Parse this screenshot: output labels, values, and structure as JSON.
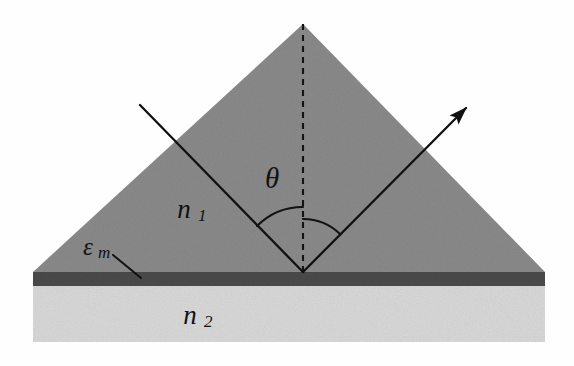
{
  "figure": {
    "name": "kretschmann-spr-prism-diagram",
    "background_color": "#fefefe"
  },
  "geometry": {
    "canvas": {
      "width": 574,
      "height": 366
    },
    "prism": {
      "apex": {
        "x": 303,
        "y": 24
      },
      "base_left": {
        "x": 33,
        "y": 272
      },
      "base_right": {
        "x": 545,
        "y": 272
      },
      "fill_color": "#8a8a8a"
    },
    "metal_film": {
      "x": 33,
      "y": 272,
      "width": 512,
      "height": 14,
      "fill_color": "#4a4a4a"
    },
    "substrate": {
      "x": 33,
      "y": 286,
      "width": 512,
      "height": 56,
      "fill_color": "#d8d8d8"
    },
    "reflection_point": {
      "x": 303,
      "y": 272
    },
    "normal_line": {
      "x": 303,
      "y_top": 24,
      "y_bottom": 272
    },
    "incident_ray": {
      "x1": 140,
      "y1": 105,
      "x2": 303,
      "y2": 272
    },
    "reflected_ray": {
      "x1": 303,
      "y1": 272,
      "x2": 470,
      "y2": 104
    },
    "leader_line": {
      "x1": 113,
      "y1": 255,
      "x2": 141,
      "y2": 278
    },
    "angle_arc_left_radius": 65,
    "angle_arc_right_radius": 53
  },
  "labels": {
    "theta": {
      "text": "θ",
      "meaning": "angle-of-incidence",
      "x": 272,
      "y": 181
    },
    "n1": {
      "symbol": "n",
      "subscript": "1",
      "meaning": "prism-refractive-index",
      "x": 184,
      "y": 212
    },
    "n2": {
      "symbol": "n",
      "subscript": "2",
      "meaning": "substrate-refractive-index",
      "x": 190,
      "y": 318
    },
    "epsilon_m": {
      "symbol": "ε",
      "subscript": "m",
      "meaning": "metal-film-permittivity",
      "x": 88,
      "y": 249
    }
  },
  "colors": {
    "prism": "#8a8a8a",
    "metal": "#4a4a4a",
    "substrate": "#d8d8d8",
    "ink": "#111111",
    "background": "#fefefe"
  }
}
